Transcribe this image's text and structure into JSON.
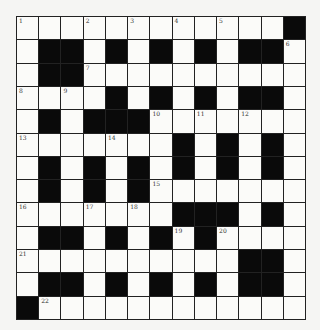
{
  "puzzle": {
    "rows": 13,
    "cols": 13,
    "colors": {
      "black": "#0a0a0a",
      "white": "#fbfbf9",
      "border": "#222222"
    },
    "grid": [
      "....... .....#",
      "x"
    ],
    "layout": [
      [
        1,
        0,
        0,
        2,
        0,
        3,
        0,
        4,
        0,
        5,
        0,
        0,
        -1
      ],
      [
        0,
        -1,
        -1,
        0,
        -1,
        0,
        -1,
        0,
        -1,
        0,
        -1,
        -1,
        6
      ],
      [
        0,
        -1,
        -1,
        7,
        0,
        0,
        0,
        0,
        0,
        0,
        0,
        0,
        0
      ],
      [
        8,
        0,
        9,
        0,
        -1,
        0,
        -1,
        0,
        -1,
        0,
        -1,
        -1,
        0
      ],
      [
        0,
        -1,
        0,
        -1,
        -1,
        -1,
        10,
        0,
        11,
        0,
        12,
        0,
        0
      ],
      [
        13,
        0,
        0,
        0,
        14,
        0,
        0,
        -1,
        0,
        -1,
        0,
        -1,
        0
      ],
      [
        0,
        -1,
        0,
        -1,
        0,
        -1,
        0,
        -1,
        0,
        -1,
        0,
        -1,
        0
      ],
      [
        0,
        -1,
        0,
        -1,
        0,
        -1,
        15,
        0,
        0,
        0,
        0,
        0,
        0
      ],
      [
        16,
        0,
        0,
        17,
        0,
        18,
        0,
        -1,
        -1,
        -1,
        0,
        -1,
        0
      ],
      [
        0,
        -1,
        -1,
        0,
        -1,
        0,
        -1,
        19,
        -1,
        20,
        0,
        0,
        0
      ],
      [
        21,
        0,
        0,
        0,
        0,
        0,
        0,
        0,
        0,
        0,
        -1,
        -1,
        0
      ],
      [
        0,
        -1,
        -1,
        0,
        -1,
        0,
        -1,
        0,
        -1,
        0,
        -1,
        -1,
        0
      ],
      [
        -1,
        22,
        0,
        0,
        0,
        0,
        0,
        0,
        0,
        0,
        0,
        0,
        0
      ]
    ]
  }
}
